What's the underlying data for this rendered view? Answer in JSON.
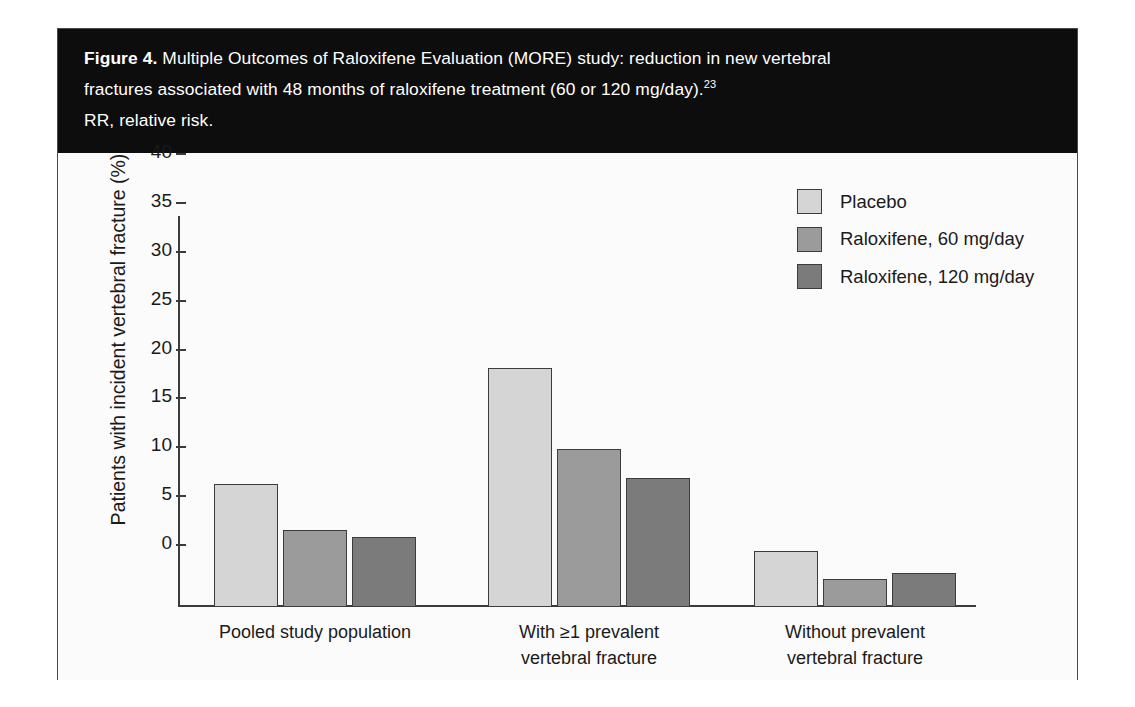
{
  "figure": {
    "label": "Figure 4.",
    "caption_line1": "Multiple Outcomes of Raloxifene Evaluation (MORE) study: reduction in new vertebral",
    "caption_line2": "fractures associated with 48 months of raloxifene treatment (60 or 120 mg/day).",
    "caption_superscript": "23",
    "caption_line3": "RR, relative risk."
  },
  "chart_data": {
    "type": "bar",
    "title": "",
    "xlabel": "",
    "ylabel": "Patients with incident vertebral fracture (%)",
    "ylim": [
      0,
      40
    ],
    "yticks": [
      "0",
      "5",
      "10",
      "15",
      "20",
      "25",
      "30",
      "35",
      "40"
    ],
    "grid": false,
    "legend_position": "top-right",
    "categories": [
      "Pooled study population",
      "With ≥1 prevalent vertebral fracture",
      "Without prevalent vertebral fracture"
    ],
    "category_lines": [
      [
        "Pooled study population"
      ],
      [
        "With ≥1 prevalent",
        "vertebral fracture"
      ],
      [
        "Without prevalent",
        "vertebral fracture"
      ]
    ],
    "series": [
      {
        "name": "Placebo",
        "color": "#d5d5d5",
        "values": [
          12.6,
          24.5,
          5.7
        ]
      },
      {
        "name": "Raloxifene, 60 mg/day",
        "color": "#9b9b9b",
        "values": [
          7.9,
          16.2,
          2.9
        ]
      },
      {
        "name": "Raloxifene, 120 mg/day",
        "color": "#7b7b7b",
        "values": [
          7.2,
          13.2,
          3.5
        ]
      }
    ]
  }
}
